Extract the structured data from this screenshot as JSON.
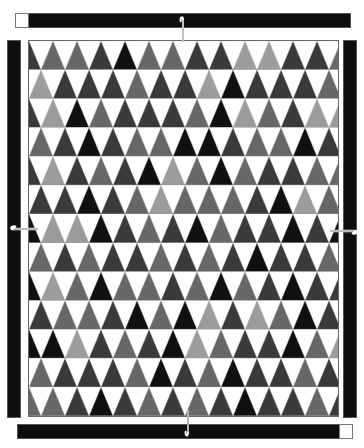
{
  "diagram": {
    "type": "quilt-pattern",
    "grid": {
      "rows": 13,
      "triangles_per_row": 13,
      "shade_codes": {
        "B": "#101010",
        "D": "#3a3a3a",
        "G": "#676767",
        "L": "#9c9c9c",
        "W": "#ffffff"
      },
      "row_patterns": [
        "DGGDBGGDDLLDDG",
        "LDDDGDDLBDDDG",
        "DLBGDDDGBLGDLL",
        "GDBDGGBBDGGBDG",
        "DLDGDBLGBGDDGG",
        "DDBDGLGGGDBLGD",
        "BLLBDGDBGDDBD",
        "GDGDDGDGDBDDGB",
        "BLGBGGDGBGDBDD",
        "DGGDBGBLDLGBD",
        "BBLDGDBLGDDBGL",
        "GDDDGBDGBDDGDD",
        "GGDBDGDGDBDDGD"
      ]
    },
    "border": {
      "strip_color": "#0e0e0e",
      "corner_square_color": "#ffffff",
      "top_strip": {
        "corner": "left"
      },
      "bottom_strip": {
        "corner": "right"
      },
      "left_strip": {},
      "right_strip": {}
    },
    "markers": [
      {
        "name": "top-hook",
        "position": "top-center"
      },
      {
        "name": "left-hook",
        "position": "left-middle"
      },
      {
        "name": "right-hook",
        "position": "right-middle"
      },
      {
        "name": "bottom-hook",
        "position": "bottom-center"
      }
    ]
  }
}
